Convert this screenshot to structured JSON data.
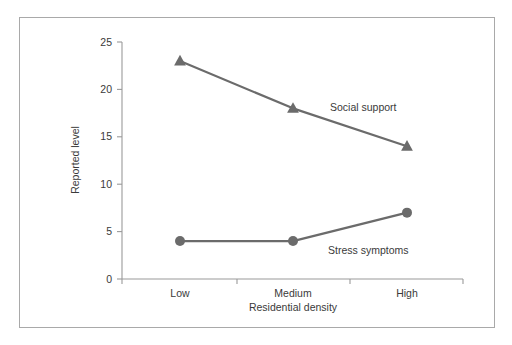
{
  "figure": {
    "clipped_top_caption": "",
    "frame_color": "#a9a9a9",
    "background": "#ffffff"
  },
  "chart_data": {
    "type": "line",
    "title": "",
    "xlabel": "Residential density",
    "ylabel": "Reported level",
    "categories": [
      "Low",
      "Medium",
      "High"
    ],
    "ylim": [
      0,
      25
    ],
    "yticks": [
      0,
      5,
      10,
      15,
      20,
      25
    ],
    "ytick_labels": [
      "0",
      "5",
      "10",
      "15",
      "20",
      "25"
    ],
    "grid": false,
    "legend_position": "inline-annotation",
    "series": [
      {
        "name": "Social support",
        "values": [
          23,
          18,
          14
        ],
        "marker": "triangle",
        "color": "#6b6b6b",
        "annotation": "Social support"
      },
      {
        "name": "Stress symptoms",
        "values": [
          4,
          4,
          7
        ],
        "marker": "circle",
        "color": "#6b6b6b",
        "annotation": "Stress symptoms"
      }
    ]
  },
  "geometry": {
    "plot_left": 122,
    "plot_right": 463,
    "plot_top": 42,
    "plot_bottom": 279,
    "category_x": [
      180,
      293,
      407
    ],
    "tick_x": [
      122,
      237,
      350,
      463
    ],
    "annotations": [
      {
        "series": "Social support",
        "x": 330,
        "y": 111
      },
      {
        "series": "Stress symptoms",
        "x": 328,
        "y": 254
      }
    ]
  }
}
